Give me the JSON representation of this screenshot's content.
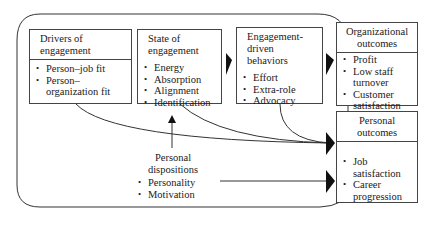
{
  "diagram": {
    "drivers": {
      "title": "Drivers of engagement",
      "title_lines": [
        "Drivers of",
        "engagement"
      ],
      "items": [
        "Person–job fit",
        "Person–",
        "organization fit"
      ]
    },
    "state": {
      "title_lines": [
        "State of",
        "engagement"
      ],
      "items": [
        "Energy",
        "Absorption",
        "Alignment",
        "Identification"
      ]
    },
    "behaviors": {
      "title_lines": [
        "Engagement-",
        "driven",
        "behaviors"
      ],
      "items": [
        "Effort",
        "Extra-role",
        "Advocacy"
      ]
    },
    "org_outcomes": {
      "title_lines": [
        "Organizational",
        "outcomes"
      ],
      "items": [
        "Profit",
        "Low staff",
        "turnover",
        "Customer",
        "satisfaction"
      ]
    },
    "personal_outcomes": {
      "title_lines": [
        "Personal",
        "outcomes"
      ],
      "items": [
        "Job satisfaction",
        "Career",
        "progression"
      ]
    },
    "dispositions": {
      "title_lines": [
        "Personal",
        "dispositions"
      ],
      "items": [
        "Personality",
        "Motivation"
      ]
    },
    "colors": {
      "line": "#333333",
      "box_border": "#444444",
      "background": "#ffffff"
    }
  }
}
